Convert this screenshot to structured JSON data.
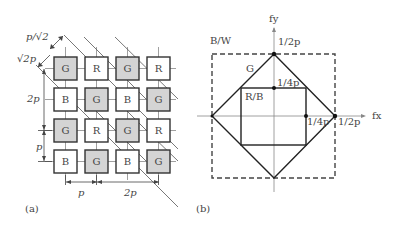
{
  "panel_a": {
    "caption": "(a)",
    "grid": [
      [
        "G",
        "R",
        "G",
        "R"
      ],
      [
        "B",
        "G",
        "B",
        "G"
      ],
      [
        "G",
        "R",
        "G",
        "R"
      ],
      [
        "B",
        "G",
        "B",
        "G"
      ]
    ],
    "labels": {
      "p_sqrt2": "p/√2",
      "sqrt2p": "√2p",
      "two_p_vertical": "2p",
      "p_vertical": "p",
      "p_horizontal": "p",
      "two_p_horizontal": "2p"
    },
    "colors": {
      "green_fill": "#d4d4d4",
      "other_fill": "#ffffff",
      "stroke": "#333333"
    }
  },
  "panel_b": {
    "caption": "(b)",
    "axis_x": "fx",
    "axis_y": "fy",
    "region_bw": "B/W",
    "region_g": "G",
    "region_rb": "R/B",
    "tick_y_half": "1/2p",
    "tick_y_quarter": "1/4p",
    "tick_x_quarter": "1/4p",
    "tick_x_half": "1/2p"
  }
}
